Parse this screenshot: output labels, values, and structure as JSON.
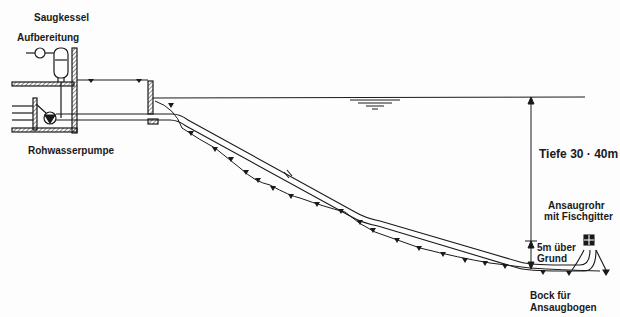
{
  "diagram": {
    "type": "cross-section",
    "labels": {
      "saugkessel": "Saugkessel",
      "aufbereitung": "Aufbereitung",
      "rohwasserpumpe": "Rohwasserpumpe",
      "tiefe": "Tiefe 30 · 40m",
      "ansaugrohr_line1": "Ansaugrohr",
      "ansaugrohr_line2": "mit Fischgitter",
      "grund_line1": "5m über",
      "grund_line2": "Grund",
      "bock_line1": "Bock für",
      "bock_line2": "Ansaugbogen"
    },
    "colors": {
      "ink": "#1a1a1a",
      "paper": "#fdfdfd"
    }
  }
}
